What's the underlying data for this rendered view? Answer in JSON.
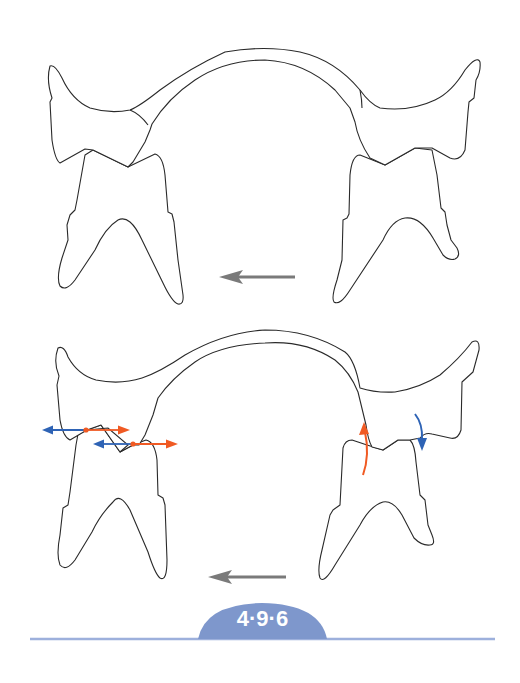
{
  "figure": {
    "label": "4·9·6",
    "panels": [
      {
        "name": "top-panel",
        "description": "Upper and lower teeth in occlusion with arch connecting left and right sides",
        "movement_arrow": {
          "direction": "left",
          "color": "#7a7a7a"
        }
      },
      {
        "name": "bottom-panel",
        "description": "Upper and lower teeth with force vectors at occlusal contacts",
        "movement_arrow": {
          "direction": "left",
          "color": "#7a7a7a"
        },
        "left_contacts": [
          {
            "arrows": [
              "left (blue)",
              "right (orange)"
            ]
          },
          {
            "arrows": [
              "left (blue)",
              "right (orange)"
            ]
          }
        ],
        "right_contacts": [
          {
            "arrow": "curved up (orange)"
          },
          {
            "arrow": "curved down (blue)"
          }
        ]
      }
    ]
  },
  "colors": {
    "outline": "#2a2a2a",
    "movement_arrow": "#7a7a7a",
    "force_blue": "#2e63b5",
    "force_orange": "#f05a23",
    "badge": "#7e97cc",
    "rule": "#9db0dc"
  }
}
